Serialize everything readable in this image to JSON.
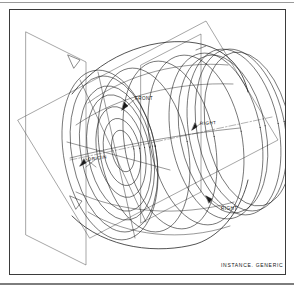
{
  "drawing": {
    "type": "cad-wireframe-isometric",
    "title_caption": "INSTANCE. GENERIC",
    "background_color": "#ffffff",
    "line_color": "#1a1a1a",
    "frame_color": "#3b3b3b",
    "datum_plane_color": "#4a4a4a",
    "axis_color": "#555555",
    "labels": {
      "front": "FRONT",
      "right_mid": "RIGHT",
      "right_low": "RIGHT",
      "origin": "ORIGIN"
    },
    "geometry": {
      "description": "Revolved cylindrical wheel/pulley body shown as wireframe with concentric circular cross-sections and three orthogonal datum planes",
      "concentric_front_ellipses_radii_x": [
        62,
        54,
        46,
        38,
        30,
        21,
        13
      ],
      "body_section_offsets_x": [
        0,
        22,
        44,
        66,
        88,
        110,
        128,
        146
      ],
      "datum_planes": 3,
      "iso_angle_deg": 30
    }
  }
}
